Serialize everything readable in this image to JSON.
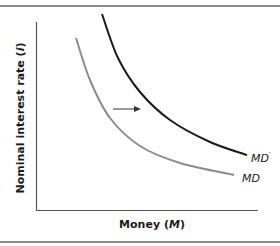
{
  "chart_data": {
    "type": "line",
    "title": "",
    "xlabel": "Money (M)",
    "xlabel_parts": {
      "text": "Money (",
      "var": "M",
      "close": ")"
    },
    "ylabel": "Nominal interest rate (i)",
    "ylabel_parts": {
      "text": "Nominal interest rate (",
      "var": "i",
      "close": ")"
    },
    "grid": false,
    "legend": "none (inline curve labels)",
    "ticks": "none",
    "series": [
      {
        "name": "MD",
        "label": "MD",
        "color": "#8c8c8c",
        "description": "Original money demand curve, downward sloping and convex",
        "points_px": [
          [
            76,
            38
          ],
          [
            90,
            80
          ],
          [
            110,
            118
          ],
          [
            140,
            146
          ],
          [
            180,
            163
          ],
          [
            234,
            175
          ]
        ]
      },
      {
        "name": "MD′",
        "label": "MD",
        "label_prime": "′",
        "color": "#1a1a1a",
        "description": "Shifted money demand curve (rightward shift)",
        "points_px": [
          [
            102,
            14
          ],
          [
            118,
            58
          ],
          [
            140,
            92
          ],
          [
            170,
            120
          ],
          [
            210,
            142
          ],
          [
            247,
            155
          ]
        ]
      }
    ],
    "annotations": [
      {
        "type": "arrow",
        "direction": "right",
        "meaning": "Money demand shifts right from MD to MD′",
        "from_px": [
          113,
          109
        ],
        "to_px": [
          140,
          109
        ]
      }
    ]
  },
  "colors": {
    "frame": "#8a8a8a",
    "axis": "#555555",
    "md_curve": "#8c8c8c",
    "md_prime_curve": "#1a1a1a",
    "text": "#1a1a1a"
  }
}
